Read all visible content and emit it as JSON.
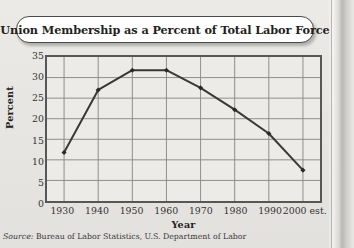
{
  "title": "Union Membership as a Percent of Total Labor Force",
  "source": {
    "prefix": "Source:",
    "text": " Bureau of Labor Statistics, U.S. Department of Labor"
  },
  "colors": {
    "page_background": "#e8e7e4",
    "plot_background": "#ecebe8",
    "frame": "#585754",
    "gridline": "#8d8c89",
    "line": "#3a3836",
    "marker": "#2b2a28",
    "title_pill": "#ffffff",
    "text": "#231f1d"
  },
  "chart_data": {
    "type": "line",
    "title": "Union Membership as a Percent of Total Labor Force",
    "xlabel": "Year",
    "ylabel": "Percent",
    "x": [
      1930,
      1940,
      1950,
      1960,
      1970,
      1980,
      1990,
      2000
    ],
    "categories": [
      "1930",
      "1940",
      "1950",
      "1960",
      "1970",
      "1980",
      "1990",
      "2000 est."
    ],
    "values": [
      11.8,
      27.0,
      31.8,
      31.8,
      27.5,
      22.2,
      16.4,
      7.5
    ],
    "series": [
      {
        "name": "Union Membership",
        "values": [
          11.8,
          27.0,
          31.8,
          31.8,
          27.5,
          22.2,
          16.4,
          7.5
        ]
      }
    ],
    "ylim": [
      0,
      35
    ],
    "xlim": [
      1925,
      2005
    ],
    "yticks": [
      0,
      5,
      10,
      15,
      20,
      25,
      30,
      35
    ],
    "ytick_labels": [
      "0",
      "5",
      "10",
      "15",
      "20",
      "25",
      "30",
      "35"
    ],
    "xticks": [
      1930,
      1940,
      1950,
      1960,
      1970,
      1980,
      1990,
      2000
    ],
    "xtick_labels": [
      "1930",
      "1940",
      "1950",
      "1960",
      "1970",
      "1980",
      "1990",
      "2000 est."
    ],
    "grid": true,
    "legend": false,
    "markers": "filled-diamond"
  }
}
